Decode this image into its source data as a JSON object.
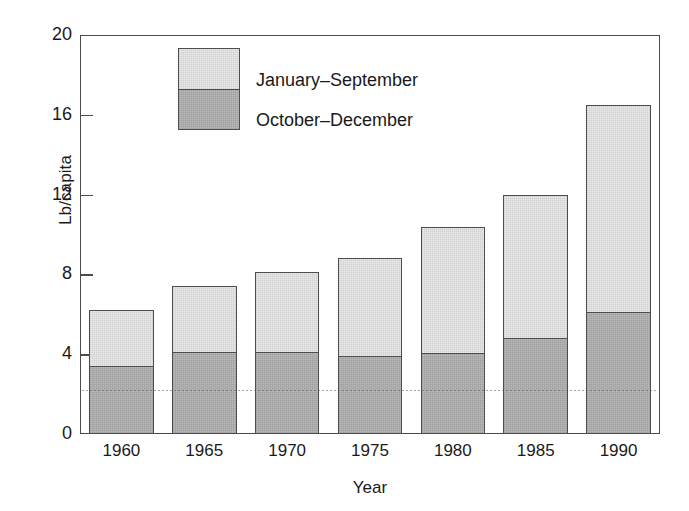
{
  "chart_data": {
    "type": "bar",
    "title": "",
    "xlabel": "Year",
    "ylabel": "Lb/capita",
    "categories": [
      "1960",
      "1965",
      "1970",
      "1975",
      "1980",
      "1985",
      "1990"
    ],
    "ylim": [
      0,
      20
    ],
    "yticks": [
      0,
      4,
      8,
      12,
      16,
      20
    ],
    "ytick_labels": [
      "0",
      "4",
      "8",
      "12",
      "16",
      "20"
    ],
    "grid": false,
    "stacked": true,
    "legend_position": "upper-left-inside",
    "series": [
      {
        "name": "October–December",
        "color": "#b9b9b9",
        "values": [
          3.4,
          4.1,
          4.1,
          3.9,
          4.05,
          4.8,
          6.1
        ]
      },
      {
        "name": "January–September",
        "color": "#e9e9e9",
        "values": [
          2.8,
          3.3,
          4.0,
          4.9,
          6.35,
          7.2,
          10.4
        ]
      }
    ],
    "totals": [
      6.2,
      7.4,
      8.1,
      8.8,
      10.4,
      12.0,
      16.5
    ]
  },
  "legend": {
    "entries": [
      {
        "label": "January–September"
      },
      {
        "label": "October–December"
      }
    ]
  },
  "axes": {
    "y_axis_label": "Lb/capita",
    "x_axis_label": "Year"
  }
}
